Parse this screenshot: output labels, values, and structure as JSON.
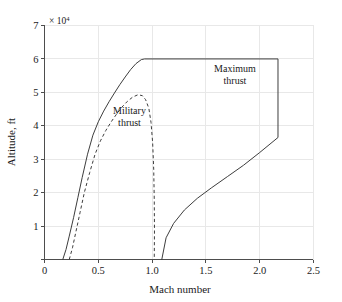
{
  "chart_data": {
    "type": "line",
    "title": "",
    "xlabel": "Mach number",
    "ylabel": "Altitude, ft",
    "y_multiplier": "× 10",
    "y_multiplier_exponent": "4",
    "xlim": [
      0,
      2.5
    ],
    "ylim": [
      0,
      70000
    ],
    "xticks": [
      0,
      0.5,
      1.0,
      1.5,
      2.0,
      2.5
    ],
    "xticklabels": [
      "0",
      "0.5",
      "1.0",
      "1.5",
      "2.0",
      "2.5"
    ],
    "yticks": [
      0,
      10000,
      20000,
      30000,
      40000,
      50000,
      60000,
      70000
    ],
    "yticklabels": [
      "",
      "1",
      "2",
      "3",
      "4",
      "5",
      "6",
      "7"
    ],
    "grid": true,
    "legend_position": "inline-annotations",
    "annotations": [
      {
        "name": "maximum-thrust-label",
        "line1": "Maximum",
        "line2": "thrust",
        "x": 1.77,
        "y": 56000
      },
      {
        "name": "military-thrust-label",
        "line1": "Military",
        "line2": "thrust",
        "x": 0.79,
        "y": 43400
      }
    ],
    "series": [
      {
        "name": "Maximum thrust",
        "style": "solid",
        "color": "#3d3d3d",
        "points": [
          [
            0.17,
            0
          ],
          [
            0.2,
            3000
          ],
          [
            0.23,
            7000
          ],
          [
            0.27,
            12500
          ],
          [
            0.31,
            18500
          ],
          [
            0.35,
            24500
          ],
          [
            0.4,
            31500
          ],
          [
            0.45,
            37200
          ],
          [
            0.5,
            41200
          ],
          [
            0.55,
            44400
          ],
          [
            0.6,
            47200
          ],
          [
            0.65,
            49800
          ],
          [
            0.7,
            52300
          ],
          [
            0.75,
            54600
          ],
          [
            0.8,
            56800
          ],
          [
            0.85,
            58600
          ],
          [
            0.9,
            59800
          ],
          [
            0.93,
            60000
          ],
          [
            2.17,
            60000
          ],
          [
            2.17,
            36500
          ],
          [
            2.0,
            32000
          ],
          [
            1.85,
            28200
          ],
          [
            1.7,
            24800
          ],
          [
            1.55,
            21400
          ],
          [
            1.42,
            18300
          ],
          [
            1.3,
            14800
          ],
          [
            1.2,
            10800
          ],
          [
            1.13,
            6500
          ],
          [
            1.09,
            0
          ]
        ]
      },
      {
        "name": "Military thrust",
        "style": "dashed",
        "color": "#3d3d3d",
        "points": [
          [
            0.23,
            0
          ],
          [
            0.26,
            3500
          ],
          [
            0.29,
            8000
          ],
          [
            0.33,
            14000
          ],
          [
            0.37,
            20000
          ],
          [
            0.42,
            26000
          ],
          [
            0.47,
            31500
          ],
          [
            0.52,
            35500
          ],
          [
            0.57,
            38600
          ],
          [
            0.62,
            41200
          ],
          [
            0.67,
            43500
          ],
          [
            0.72,
            45600
          ],
          [
            0.77,
            47300
          ],
          [
            0.82,
            48600
          ],
          [
            0.87,
            49300
          ],
          [
            0.91,
            49000
          ],
          [
            0.94,
            47800
          ],
          [
            0.97,
            45200
          ],
          [
            0.99,
            41000
          ],
          [
            1.005,
            35000
          ],
          [
            1.015,
            27000
          ],
          [
            1.02,
            18000
          ],
          [
            1.022,
            9000
          ],
          [
            1.02,
            0
          ]
        ]
      }
    ]
  }
}
